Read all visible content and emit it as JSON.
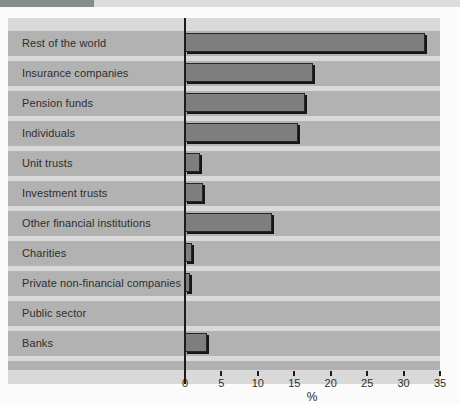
{
  "page": {
    "background": "#fbfbfb"
  },
  "header": {
    "accent_bar_color": "#868b8b",
    "strip_color": "#dcdcdc"
  },
  "chart_data": {
    "type": "bar",
    "orientation": "horizontal",
    "categories": [
      "Rest of the world",
      "Insurance companies",
      "Pension funds",
      "Individuals",
      "Unit trusts",
      "Investment trusts",
      "Other financial institutions",
      "Charities",
      "Private non-financial companies",
      "Public sector",
      "Banks"
    ],
    "values": [
      33,
      17.5,
      16.5,
      15.5,
      2,
      2.5,
      12,
      1,
      0.7,
      0,
      3
    ],
    "xlabel": "%",
    "xlim": [
      0,
      35
    ],
    "xticks": [
      0,
      5,
      10,
      15,
      20,
      25,
      30,
      35
    ],
    "grid": false,
    "legend_shown": false,
    "colors": {
      "bar": "#7e7e7e",
      "bar_outline": "#262626",
      "bar_shadow": "#161616",
      "row_band": "#b2b2b2",
      "row_gap": "#d9d9d9",
      "axis": "#1c1c1c",
      "text": "#2e2e2e"
    }
  }
}
